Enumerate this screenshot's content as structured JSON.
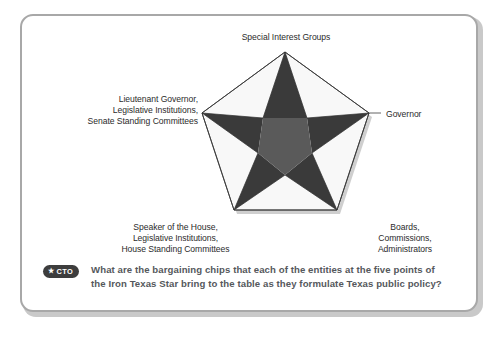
{
  "figure": {
    "title": "Iron Texas Star",
    "frame_border_color": "#a8a8a8",
    "background_color": "#ffffff"
  },
  "diagram": {
    "type": "five-pointed-star-pentagon",
    "pentagon_fill": "#f8f8f8",
    "pentagon_stroke": "#3c3c3c",
    "star_point_fill": "#3a3a3a",
    "star_core_fill": "#5a5a5a",
    "shadow_color": "#cfcfcf",
    "labels": {
      "top": "Special Interest Groups",
      "left": "Lieutenant Governor,\nLegislative Institutions,\nSenate Standing Committees",
      "right": "Governor",
      "bottom_left": "Speaker of the House,\nLegislative Institutions,\nHouse Standing Committees",
      "bottom_right": "Boards,\nCommissions,\nAdministrators"
    }
  },
  "caption": {
    "badge_star": "★",
    "badge_label": "CTO",
    "badge_bg_color": "#3d3d3d",
    "text": "What are the bargaining chips that each of the entities at the five points of the Iron Texas Star bring to the table as they formulate Texas public policy?",
    "text_color": "#55585c"
  }
}
